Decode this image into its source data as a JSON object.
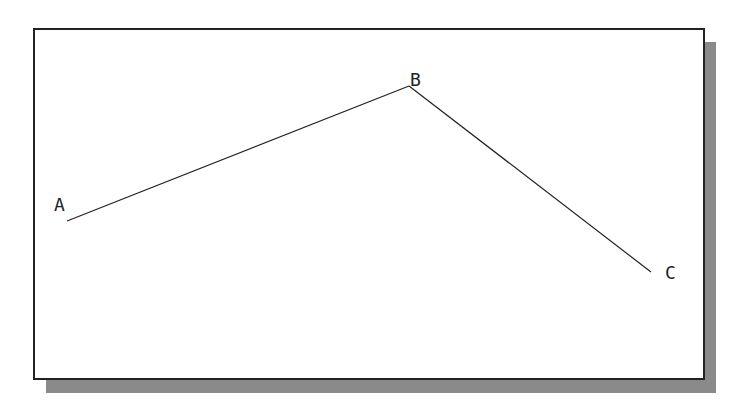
{
  "diagram": {
    "points": [
      {
        "id": "A",
        "label": "A",
        "x": 67,
        "y": 221,
        "label_x": 54,
        "label_y": 211
      },
      {
        "id": "B",
        "label": "B",
        "x": 409,
        "y": 86,
        "label_x": 410,
        "label_y": 86
      },
      {
        "id": "C",
        "label": "C",
        "x": 651,
        "y": 272,
        "label_x": 665,
        "label_y": 279
      }
    ],
    "segments": [
      {
        "from": "A",
        "to": "B"
      },
      {
        "from": "B",
        "to": "C"
      }
    ],
    "colors": {
      "line": "#222222",
      "shadow": "#8a8a8a",
      "frame": "#222222",
      "background": "#ffffff"
    }
  }
}
